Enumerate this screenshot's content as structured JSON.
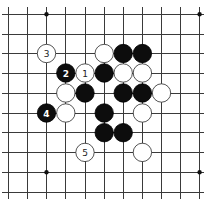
{
  "diagram": {
    "type": "go-board-fragment",
    "grid": {
      "columns": 11,
      "rows": 10,
      "col_x": [
        8.5,
        27.5,
        46.5,
        65.8,
        85,
        104.2,
        123.2,
        142.4,
        161.5,
        180.6,
        199.6
      ],
      "row_y": [
        14.3,
        34,
        53.5,
        73,
        93,
        113,
        132.7,
        152.4,
        172.2,
        192.2
      ],
      "extend": {
        "left": 2,
        "right": 204,
        "top": 7,
        "bottom": 199
      }
    },
    "star_points": [
      {
        "col": 2,
        "row": 0
      },
      {
        "col": 10,
        "row": 0
      },
      {
        "col": 2,
        "row": 8
      },
      {
        "col": 10,
        "row": 8
      }
    ],
    "stone_radius": 9.2,
    "stones": [
      {
        "color": "white",
        "col": 2,
        "row": 2,
        "label": "3"
      },
      {
        "color": "white",
        "col": 5,
        "row": 2,
        "label": ""
      },
      {
        "color": "black",
        "col": 6,
        "row": 2,
        "label": ""
      },
      {
        "color": "black",
        "col": 7,
        "row": 2,
        "label": ""
      },
      {
        "color": "black",
        "col": 3,
        "row": 3,
        "label": "2"
      },
      {
        "color": "white",
        "col": 4,
        "row": 3,
        "label": "1"
      },
      {
        "color": "black",
        "col": 5,
        "row": 3,
        "label": ""
      },
      {
        "color": "white",
        "col": 6,
        "row": 3,
        "label": ""
      },
      {
        "color": "white",
        "col": 7,
        "row": 3,
        "label": ""
      },
      {
        "color": "white",
        "col": 3,
        "row": 4,
        "label": ""
      },
      {
        "color": "black",
        "col": 4,
        "row": 4,
        "label": ""
      },
      {
        "color": "black",
        "col": 6,
        "row": 4,
        "label": ""
      },
      {
        "color": "black",
        "col": 7,
        "row": 4,
        "label": ""
      },
      {
        "color": "white",
        "col": 8,
        "row": 4,
        "label": ""
      },
      {
        "color": "black",
        "col": 2,
        "row": 5,
        "label": "4"
      },
      {
        "color": "white",
        "col": 3,
        "row": 5,
        "label": ""
      },
      {
        "color": "black",
        "col": 5,
        "row": 5,
        "label": ""
      },
      {
        "color": "white",
        "col": 7,
        "row": 5,
        "label": ""
      },
      {
        "color": "black",
        "col": 5,
        "row": 6,
        "label": ""
      },
      {
        "color": "black",
        "col": 6,
        "row": 6,
        "label": ""
      },
      {
        "color": "white",
        "col": 4,
        "row": 7,
        "label": "5"
      },
      {
        "color": "white",
        "col": 7,
        "row": 7,
        "label": ""
      }
    ],
    "colors": {
      "background": "#ffffff",
      "line": "#3a3a3a",
      "black_stone": "#0d0d0d",
      "white_stone": "#ffffff"
    }
  }
}
